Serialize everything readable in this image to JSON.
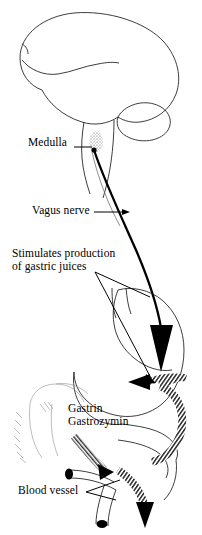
{
  "diagram": {
    "type": "anatomical-line-drawing",
    "background_color": "#ffffff",
    "ink_color": "#000000",
    "labels": {
      "medulla": "Medulla",
      "vagus_nerve": "Vagus nerve",
      "stimulates_line1": "Stimulates production",
      "stimulates_line2": "of gastric juices",
      "gastrin": "Gastrin",
      "gastrozymin": "Gastrozymin",
      "blood_vessel": "Blood vessel"
    },
    "structures": [
      {
        "name": "cerebrum",
        "description": "large outlined brain hemisphere at top"
      },
      {
        "name": "cerebellum",
        "description": "smaller lobe below and right of cerebrum"
      },
      {
        "name": "brainstem",
        "description": "narrow stalk descending from brain"
      },
      {
        "name": "medulla-stipple",
        "description": "stippled oval region on brainstem"
      },
      {
        "name": "stomach",
        "description": "outlined stomach in lower half"
      },
      {
        "name": "duodenum",
        "description": "curved tube leaving stomach"
      },
      {
        "name": "liver-sketch",
        "description": "faint sketched outline at left"
      },
      {
        "name": "blood-vessel-tube",
        "description": "cut vessel with dark lumen"
      }
    ],
    "arrows": [
      {
        "name": "vagus-nerve-arrow",
        "style": "solid-black",
        "from": "medulla",
        "to": "stomach",
        "direction": "down"
      },
      {
        "name": "gastric-juice-pointer",
        "style": "thin-line",
        "from": "stimulates-label",
        "to": "stomach-wall"
      },
      {
        "name": "gastrin-release-arrow-upper",
        "style": "hatched",
        "direction": "left"
      },
      {
        "name": "gastrin-release-arrow-left",
        "style": "hatched",
        "direction": "down-right"
      },
      {
        "name": "gastrin-circulation-arrow",
        "style": "hatched",
        "direction": "curved-clockwise"
      },
      {
        "name": "gastrin-outflow-arrow",
        "style": "hatched",
        "direction": "down"
      }
    ]
  }
}
